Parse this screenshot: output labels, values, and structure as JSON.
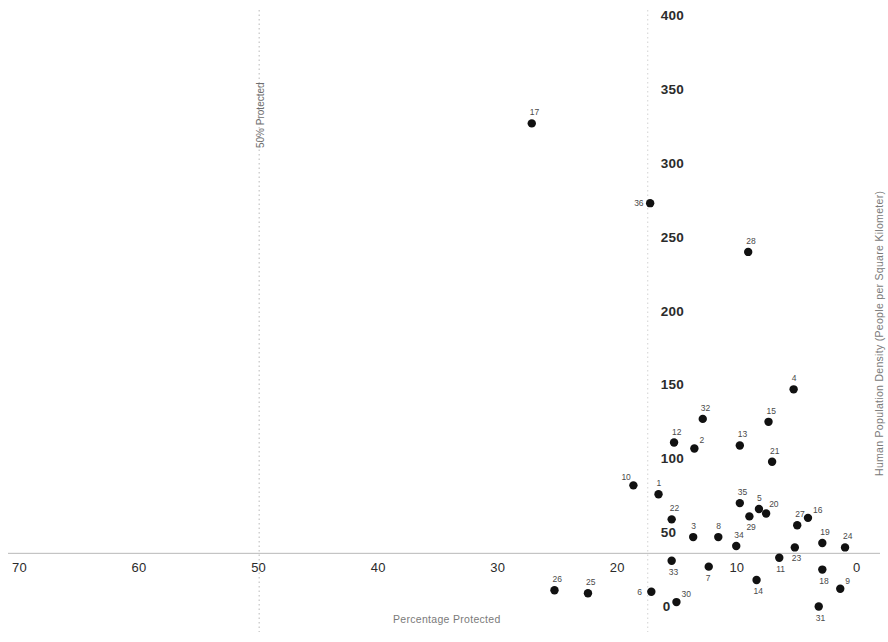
{
  "chart_data": {
    "type": "scatter",
    "title": "",
    "xlabel": "Percentage Protected",
    "ylabel": "Human Population Density (People per Square Kilometer)",
    "xlim": [
      70,
      0
    ],
    "x_reversed": true,
    "ylim": [
      0,
      400
    ],
    "xticks": [
      70,
      60,
      50,
      40,
      30,
      20,
      10,
      0
    ],
    "yticks": [
      0,
      50,
      100,
      150,
      200,
      250,
      300,
      350,
      400
    ],
    "grid": false,
    "legend": null,
    "annotations": [
      {
        "text": "50% Protected",
        "x": 50,
        "orientation": "vertical",
        "style": "dotted-line"
      }
    ],
    "reference_lines": [
      {
        "axis": "x",
        "value": 50,
        "style": "dotted",
        "label": "50% Protected"
      },
      {
        "axis": "x",
        "value": 17.5,
        "style": "dotted",
        "label": ""
      },
      {
        "axis": "y",
        "value": 37,
        "style": "solid",
        "label": ""
      }
    ],
    "point_labels_shown": true,
    "points": [
      {
        "label": "1",
        "x": 16.6,
        "y": 77
      },
      {
        "label": "2",
        "x": 13.6,
        "y": 108
      },
      {
        "label": "3",
        "x": 13.7,
        "y": 48
      },
      {
        "label": "4",
        "x": 5.3,
        "y": 148
      },
      {
        "label": "5",
        "x": 8.2,
        "y": 67
      },
      {
        "label": "6",
        "x": 17.2,
        "y": 11
      },
      {
        "label": "7",
        "x": 12.4,
        "y": 28
      },
      {
        "label": "8",
        "x": 11.6,
        "y": 48
      },
      {
        "label": "9",
        "x": 1.4,
        "y": 13
      },
      {
        "label": "10",
        "x": 18.7,
        "y": 83
      },
      {
        "label": "11",
        "x": 6.5,
        "y": 34
      },
      {
        "label": "12",
        "x": 15.3,
        "y": 112
      },
      {
        "label": "13",
        "x": 9.8,
        "y": 110
      },
      {
        "label": "14",
        "x": 8.4,
        "y": 19
      },
      {
        "label": "15",
        "x": 7.4,
        "y": 126
      },
      {
        "label": "16",
        "x": 4.1,
        "y": 61
      },
      {
        "label": "17",
        "x": 27.2,
        "y": 328
      },
      {
        "label": "18",
        "x": 2.9,
        "y": 26
      },
      {
        "label": "19",
        "x": 2.9,
        "y": 44
      },
      {
        "label": "20",
        "x": 7.6,
        "y": 64
      },
      {
        "label": "21",
        "x": 7.1,
        "y": 99
      },
      {
        "label": "22",
        "x": 15.5,
        "y": 60
      },
      {
        "label": "23",
        "x": 5.2,
        "y": 41
      },
      {
        "label": "24",
        "x": 1.0,
        "y": 41
      },
      {
        "label": "25",
        "x": 22.5,
        "y": 10
      },
      {
        "label": "26",
        "x": 25.3,
        "y": 12
      },
      {
        "label": "27",
        "x": 5.0,
        "y": 56
      },
      {
        "label": "28",
        "x": 9.1,
        "y": 241
      },
      {
        "label": "29",
        "x": 9.0,
        "y": 62
      },
      {
        "label": "30",
        "x": 15.1,
        "y": 4
      },
      {
        "label": "31",
        "x": 3.2,
        "y": 1
      },
      {
        "label": "32",
        "x": 12.9,
        "y": 128
      },
      {
        "label": "33",
        "x": 15.5,
        "y": 32
      },
      {
        "label": "34",
        "x": 10.1,
        "y": 42
      },
      {
        "label": "35",
        "x": 9.8,
        "y": 71
      },
      {
        "label": "36",
        "x": 17.3,
        "y": 274
      }
    ]
  },
  "style": {
    "point_color": "#111111",
    "point_radius": 4.2,
    "axis_color": "#b8b8b8",
    "tick_text_color": "#2b2b2b",
    "label_text_color": "#4a4a4a",
    "title_text_color": "#7a7a7a",
    "background": "#ffffff"
  }
}
